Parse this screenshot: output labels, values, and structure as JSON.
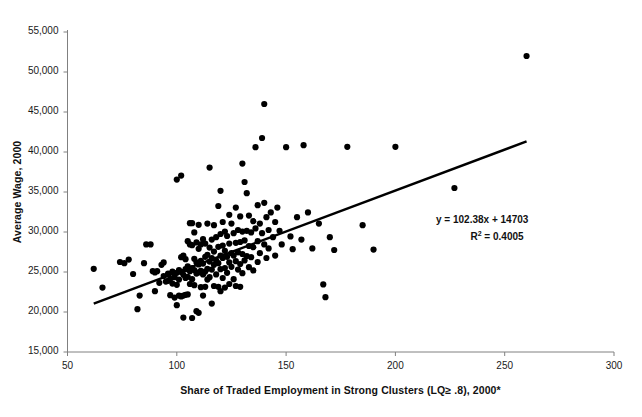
{
  "chart_data": {
    "type": "scatter",
    "title": "",
    "xlabel": "Share of Traded Employment in Strong Clusters (LQ≥ .8), 2000*",
    "ylabel": "Average Wage, 2000",
    "xlim": [
      50,
      300
    ],
    "ylim": [
      15000,
      55000
    ],
    "xticks": [
      50,
      100,
      150,
      200,
      250,
      300
    ],
    "xtick_labels": [
      "50",
      "100",
      "150",
      "200",
      "250",
      "300"
    ],
    "yticks": [
      15000,
      20000,
      25000,
      30000,
      35000,
      40000,
      45000,
      50000,
      55000
    ],
    "ytick_labels": [
      "15,000",
      "20,000",
      "25,000",
      "30,000",
      "35,000",
      "40,000",
      "45,000",
      "50,000",
      "55,000"
    ],
    "grid": false,
    "legend": "none",
    "marker_color": "#000000",
    "marker_size": 3.1,
    "trendline": {
      "equation_text": "y = 102.38x + 14703",
      "r_squared_label": "R",
      "r_squared_sup": "2",
      "r_squared_text": " = 0.4005",
      "slope": 102.38,
      "intercept": 14703,
      "r_squared": 0.4005,
      "x_start": 62,
      "x_end": 260,
      "color": "#000000",
      "width": 2.4
    },
    "axis_color": "#808080",
    "points": [
      [
        62,
        25400
      ],
      [
        66,
        23050
      ],
      [
        74,
        26250
      ],
      [
        76,
        26100
      ],
      [
        78,
        26550
      ],
      [
        80,
        24750
      ],
      [
        82,
        20350
      ],
      [
        83,
        22050
      ],
      [
        85,
        26100
      ],
      [
        86,
        28450
      ],
      [
        88,
        28450
      ],
      [
        89,
        25100
      ],
      [
        90,
        24950
      ],
      [
        90,
        22600
      ],
      [
        91,
        25100
      ],
      [
        92,
        23650
      ],
      [
        93,
        25900
      ],
      [
        94,
        26200
      ],
      [
        94,
        24500
      ],
      [
        95,
        23800
      ],
      [
        96,
        24800
      ],
      [
        96,
        23900
      ],
      [
        97,
        24150
      ],
      [
        97,
        22100
      ],
      [
        98,
        25050
      ],
      [
        98,
        23550
      ],
      [
        99,
        24350
      ],
      [
        99,
        21800
      ],
      [
        100,
        36550
      ],
      [
        100,
        24900
      ],
      [
        100,
        23400
      ],
      [
        100,
        20850
      ],
      [
        101,
        25250
      ],
      [
        101,
        24050
      ],
      [
        101,
        22050
      ],
      [
        102,
        37050
      ],
      [
        102,
        26850
      ],
      [
        102,
        25000
      ],
      [
        102,
        21950
      ],
      [
        103,
        27050
      ],
      [
        103,
        24650
      ],
      [
        103,
        22050
      ],
      [
        103,
        19300
      ],
      [
        104,
        26600
      ],
      [
        104,
        25350
      ],
      [
        104,
        24250
      ],
      [
        104,
        22150
      ],
      [
        105,
        28850
      ],
      [
        105,
        25700
      ],
      [
        105,
        24400
      ],
      [
        105,
        22200
      ],
      [
        106,
        31100
      ],
      [
        106,
        28450
      ],
      [
        106,
        25100
      ],
      [
        106,
        23500
      ],
      [
        107,
        31100
      ],
      [
        107,
        28350
      ],
      [
        107,
        25500
      ],
      [
        107,
        24100
      ],
      [
        107,
        19250
      ],
      [
        108,
        29950
      ],
      [
        108,
        26650
      ],
      [
        108,
        25250
      ],
      [
        108,
        23350
      ],
      [
        109,
        28700
      ],
      [
        109,
        26200
      ],
      [
        109,
        24800
      ],
      [
        109,
        20100
      ],
      [
        110,
        30900
      ],
      [
        110,
        27900
      ],
      [
        110,
        25950
      ],
      [
        110,
        24950
      ],
      [
        110,
        19900
      ],
      [
        111,
        28450
      ],
      [
        111,
        26400
      ],
      [
        111,
        25150
      ],
      [
        111,
        23100
      ],
      [
        112,
        29100
      ],
      [
        112,
        26050
      ],
      [
        112,
        24700
      ],
      [
        112,
        22050
      ],
      [
        113,
        28550
      ],
      [
        113,
        26900
      ],
      [
        113,
        25050
      ],
      [
        113,
        23150
      ],
      [
        114,
        31050
      ],
      [
        114,
        27150
      ],
      [
        114,
        25400
      ],
      [
        114,
        24050
      ],
      [
        115,
        38050
      ],
      [
        115,
        28050
      ],
      [
        115,
        26300
      ],
      [
        115,
        24350
      ],
      [
        116,
        29050
      ],
      [
        116,
        26750
      ],
      [
        116,
        25300
      ],
      [
        116,
        21050
      ],
      [
        117,
        30850
      ],
      [
        117,
        27550
      ],
      [
        117,
        25900
      ],
      [
        117,
        23250
      ],
      [
        118,
        29350
      ],
      [
        118,
        26450
      ],
      [
        118,
        24700
      ],
      [
        119,
        33250
      ],
      [
        119,
        28150
      ],
      [
        119,
        26100
      ],
      [
        119,
        23150
      ],
      [
        120,
        35150
      ],
      [
        120,
        29750
      ],
      [
        120,
        27050
      ],
      [
        120,
        25350
      ],
      [
        120,
        22600
      ],
      [
        121,
        31250
      ],
      [
        121,
        28300
      ],
      [
        121,
        26750
      ],
      [
        121,
        24250
      ],
      [
        122,
        30050
      ],
      [
        122,
        27650
      ],
      [
        122,
        25500
      ],
      [
        122,
        23050
      ],
      [
        123,
        29500
      ],
      [
        123,
        26900
      ],
      [
        123,
        24900
      ],
      [
        124,
        32150
      ],
      [
        124,
        28550
      ],
      [
        124,
        26200
      ],
      [
        124,
        23500
      ],
      [
        125,
        31050
      ],
      [
        125,
        27350
      ],
      [
        125,
        25650
      ],
      [
        126,
        29850
      ],
      [
        126,
        27050
      ],
      [
        126,
        24100
      ],
      [
        127,
        33050
      ],
      [
        127,
        28650
      ],
      [
        127,
        26350
      ],
      [
        127,
        23250
      ],
      [
        128,
        30250
      ],
      [
        128,
        27450
      ],
      [
        128,
        25300
      ],
      [
        129,
        31950
      ],
      [
        129,
        28750
      ],
      [
        129,
        26000
      ],
      [
        129,
        23150
      ],
      [
        130,
        38550
      ],
      [
        130,
        30050
      ],
      [
        130,
        27250
      ],
      [
        130,
        24850
      ],
      [
        131,
        36250
      ],
      [
        131,
        28950
      ],
      [
        131,
        26450
      ],
      [
        132,
        34850
      ],
      [
        132,
        30150
      ],
      [
        132,
        27000
      ],
      [
        133,
        32050
      ],
      [
        133,
        28250
      ],
      [
        133,
        25600
      ],
      [
        134,
        29950
      ],
      [
        134,
        26850
      ],
      [
        135,
        31350
      ],
      [
        135,
        28100
      ],
      [
        135,
        25200
      ],
      [
        136,
        40600
      ],
      [
        136,
        30450
      ],
      [
        137,
        33350
      ],
      [
        137,
        28850
      ],
      [
        137,
        26250
      ],
      [
        138,
        31050
      ],
      [
        138,
        27350
      ],
      [
        139,
        41750
      ],
      [
        139,
        29850
      ],
      [
        140,
        46000
      ],
      [
        140,
        33650
      ],
      [
        140,
        28450
      ],
      [
        141,
        31850
      ],
      [
        141,
        26750
      ],
      [
        142,
        30250
      ],
      [
        142,
        27950
      ],
      [
        143,
        32450
      ],
      [
        144,
        29350
      ],
      [
        145,
        31250
      ],
      [
        145,
        27050
      ],
      [
        146,
        33050
      ],
      [
        147,
        30150
      ],
      [
        148,
        28450
      ],
      [
        150,
        40600
      ],
      [
        152,
        29450
      ],
      [
        153,
        27850
      ],
      [
        155,
        31850
      ],
      [
        157,
        29050
      ],
      [
        158,
        40850
      ],
      [
        160,
        32450
      ],
      [
        162,
        27950
      ],
      [
        165,
        31050
      ],
      [
        167,
        23450
      ],
      [
        168,
        21850
      ],
      [
        170,
        29350
      ],
      [
        172,
        27750
      ],
      [
        178,
        40650
      ],
      [
        185,
        30850
      ],
      [
        190,
        27800
      ],
      [
        200,
        40650
      ],
      [
        227,
        35500
      ],
      [
        260,
        52000
      ]
    ]
  }
}
